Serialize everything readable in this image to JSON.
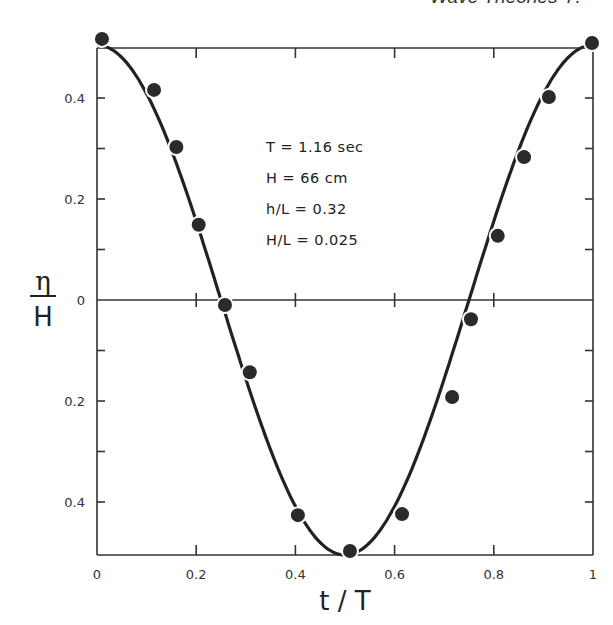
{
  "header": {
    "running_title": "Wave Theories",
    "page_number": "7."
  },
  "chart_data": {
    "type": "scatter",
    "title": "",
    "xlabel": "t / T",
    "ylabel": "η / H",
    "ylabel_numerator": "η",
    "ylabel_denominator": "H",
    "xlim": [
      0,
      1
    ],
    "ylim": [
      -0.5,
      0.5
    ],
    "x_ticks": [
      0,
      0.2,
      0.4,
      0.6,
      0.8,
      1
    ],
    "x_tick_labels": [
      "0",
      "0.2",
      "0.4",
      "0.6",
      "0.8",
      "1"
    ],
    "y_ticks": [
      0.4,
      0.2,
      0,
      -0.2,
      -0.4
    ],
    "y_tick_labels": [
      "0.4",
      "0.2",
      "0",
      "0.2",
      "0.4"
    ],
    "grid": false,
    "legend": null,
    "annotations": [
      "T  = 1.16  sec",
      "H  = 66  cm",
      "h/L = 0.32",
      "H/L = 0.025"
    ],
    "series": [
      {
        "name": "measured",
        "marker": "filled-circle",
        "x": [
          0.01,
          0.115,
          0.16,
          0.205,
          0.258,
          0.308,
          0.405,
          0.51,
          0.615,
          0.716,
          0.754,
          0.808,
          0.861,
          0.911,
          0.998
        ],
        "y": [
          0.517,
          0.416,
          0.303,
          0.149,
          -0.01,
          -0.143,
          -0.426,
          -0.497,
          -0.424,
          -0.192,
          -0.038,
          0.127,
          0.283,
          0.402,
          0.509
        ]
      },
      {
        "name": "theory",
        "style": "solid-line",
        "description": "smooth cosine-like curve, crest at t/T=0 and 1, trough at t/T≈0.5",
        "x": [
          0,
          0.05,
          0.1,
          0.15,
          0.2,
          0.25,
          0.3,
          0.35,
          0.4,
          0.45,
          0.5,
          0.55,
          0.6,
          0.65,
          0.7,
          0.75,
          0.8,
          0.85,
          0.9,
          0.95,
          1
        ],
        "y": [
          0.51,
          0.49,
          0.43,
          0.33,
          0.18,
          0.01,
          -0.15,
          -0.3,
          -0.42,
          -0.48,
          -0.5,
          -0.48,
          -0.42,
          -0.31,
          -0.17,
          -0.01,
          0.17,
          0.32,
          0.43,
          0.49,
          0.51
        ]
      }
    ]
  }
}
